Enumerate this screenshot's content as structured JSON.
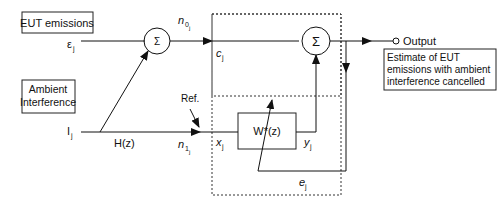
{
  "diagram": {
    "blocks": {
      "eut_emissions": "EUT emissions",
      "ambient_line1": "Ambient",
      "ambient_line2": "Interference",
      "filter": "W*(z)",
      "output_desc_line1": "Estimate of EUT",
      "output_desc_line2": "emissions with ambient",
      "output_desc_line3": "interference cancelled"
    },
    "symbols": {
      "sum1": "Σ",
      "sum2": "Σ",
      "signal_e": "ε",
      "signal_e_sub": "j",
      "signal_i": "I",
      "signal_i_sub": "j",
      "n0": "n",
      "n0_sub": "0",
      "n0_subsub": "j",
      "c": "c",
      "c_sub": "j",
      "n1": "n",
      "n1_sub": "1",
      "n1_subsub": "j",
      "x": "x",
      "x_sub": "j",
      "y": "y",
      "y_sub": "j",
      "err": "e",
      "err_sub": "j",
      "hz": "H(z)",
      "ref": "Ref.",
      "output": "Output"
    }
  }
}
